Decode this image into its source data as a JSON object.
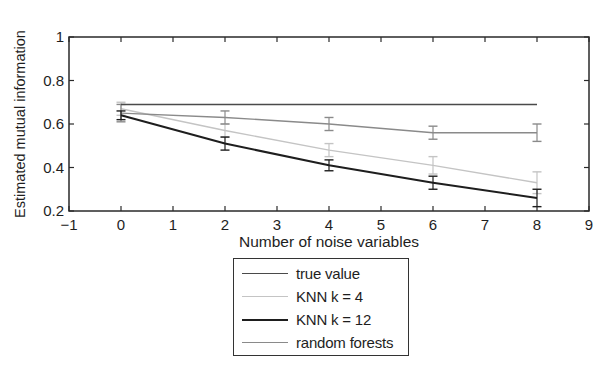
{
  "chart_data": {
    "type": "line",
    "title": "",
    "xlabel": "Number of noise variables",
    "ylabel": "Estimated mutual information",
    "xlim": [
      -1,
      9
    ],
    "ylim": [
      0.2,
      1
    ],
    "xticks": [
      -1,
      0,
      1,
      2,
      3,
      4,
      5,
      6,
      7,
      8,
      9
    ],
    "xtick_labels": [
      "−1",
      "0",
      "1",
      "2",
      "3",
      "4",
      "5",
      "6",
      "7",
      "8",
      "9"
    ],
    "yticks": [
      0.2,
      0.4,
      0.6,
      0.8,
      1
    ],
    "ytick_labels": [
      "0.2",
      "0.4",
      "0.6",
      "0.8",
      "1"
    ],
    "grid": false,
    "legend_position": "below-plot",
    "x": [
      0,
      2,
      4,
      6,
      8
    ],
    "series": [
      {
        "name": "true value",
        "color": "#4a4a4a",
        "width": 1.6,
        "values": [
          0.69,
          0.69,
          0.69,
          0.69,
          0.69
        ],
        "errors": [
          0,
          0,
          0,
          0,
          0
        ]
      },
      {
        "name": "KNN k = 4",
        "color": "#c4c4c4",
        "width": 1.4,
        "values": [
          0.67,
          0.57,
          0.48,
          0.41,
          0.33
        ],
        "errors": [
          0.03,
          0.03,
          0.03,
          0.04,
          0.05
        ]
      },
      {
        "name": "KNN k = 12",
        "color": "#1e1e1e",
        "width": 2.0,
        "values": [
          0.64,
          0.51,
          0.41,
          0.33,
          0.26
        ],
        "errors": [
          0.02,
          0.03,
          0.025,
          0.03,
          0.04
        ]
      },
      {
        "name": "random forests",
        "color": "#8a8a8a",
        "width": 1.4,
        "values": [
          0.65,
          0.63,
          0.6,
          0.56,
          0.56
        ],
        "errors": [
          0.04,
          0.03,
          0.03,
          0.03,
          0.04
        ]
      }
    ]
  },
  "legend": {
    "items": [
      {
        "label": "true value",
        "color": "#4a4a4a",
        "width": 1.6
      },
      {
        "label": "KNN k = 4",
        "color": "#c4c4c4",
        "width": 1.4
      },
      {
        "label": "KNN k = 12",
        "color": "#1e1e1e",
        "width": 2.0
      },
      {
        "label": "random forests",
        "color": "#8a8a8a",
        "width": 1.4
      }
    ]
  }
}
